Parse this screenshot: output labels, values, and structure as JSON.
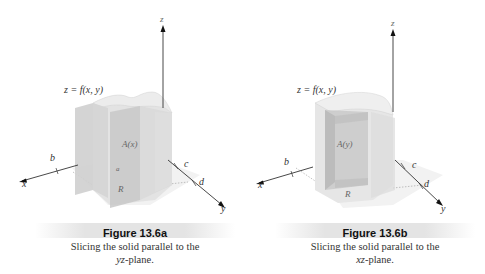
{
  "figures": [
    {
      "id": "a",
      "title": "Figure 13.6a",
      "caption_line1": "Slicing the solid parallel to the",
      "caption_plane": "yz",
      "caption_suffix": "-plane.",
      "surface_label": "z = f(x, y)",
      "axis_x": "x",
      "axis_y": "y",
      "axis_z": "z",
      "label_b": "b",
      "label_c": "c",
      "label_d": "d",
      "region_label": "R",
      "slice_label": "A(x)",
      "slice_extra": "a"
    },
    {
      "id": "b",
      "title": "Figure 13.6b",
      "caption_line1": "Slicing the solid parallel to the",
      "caption_plane": "xz",
      "caption_suffix": "-plane.",
      "surface_label": "z = f(x, y)",
      "axis_x": "x",
      "axis_y": "y",
      "axis_z": "z",
      "label_b": "b",
      "label_c": "c",
      "label_d": "d",
      "region_label": "R",
      "slice_label": "A(y)"
    }
  ],
  "colors": {
    "solid_face": "#d9d9d9",
    "solid_dark": "#c4c4c4",
    "slice_face": "#cfcfcf",
    "axis": "#333333",
    "banner": "#e4e4e4"
  }
}
